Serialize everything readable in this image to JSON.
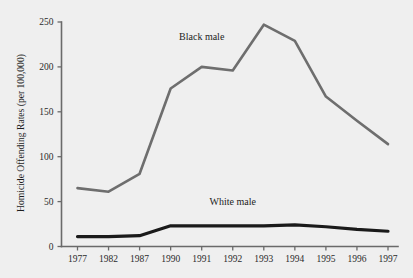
{
  "chart_data": {
    "type": "line",
    "title": "",
    "subtitle": "",
    "xlabel": "",
    "ylabel": "Homicide Offending Rates  (per 100,000)",
    "categories": [
      "1977",
      "1982",
      "1987",
      "1990",
      "1991",
      "1992",
      "1993",
      "1994",
      "1995",
      "1996",
      "1997"
    ],
    "x": [
      "1977",
      "1982",
      "1987",
      "1990",
      "1991",
      "1992",
      "1993",
      "1994",
      "1995",
      "1996",
      "1997"
    ],
    "ylim": [
      0,
      250
    ],
    "yticks": [
      "0",
      "50",
      "100",
      "150",
      "200",
      "250"
    ],
    "ytick_values": [
      0,
      50,
      100,
      150,
      200,
      250
    ],
    "grid": false,
    "legend_position": "inline-annotation",
    "series": [
      {
        "name": "Black male",
        "color": "#6e6e6e",
        "values": [
          65,
          61,
          81,
          176,
          200,
          196,
          247,
          229,
          167,
          140,
          114
        ],
        "annotation": "Black male",
        "annotation_x": "1991",
        "annotation_y": 230
      },
      {
        "name": "White male",
        "color": "#1a1a1a",
        "values": [
          11,
          11,
          12,
          23,
          23,
          23,
          23,
          24,
          22,
          19,
          17
        ],
        "annotation": "White male",
        "annotation_x": "1992",
        "annotation_y": 46
      }
    ],
    "annotations": [
      {
        "text": "Black male",
        "series": "Black male"
      },
      {
        "text": "White male",
        "series": "White male"
      }
    ],
    "colors": {
      "background": "#efefef",
      "axis": "#6a6a6a",
      "text": "#1d1d1d",
      "black_male_line": "#6e6e6e",
      "white_male_line": "#1a1a1a"
    }
  }
}
